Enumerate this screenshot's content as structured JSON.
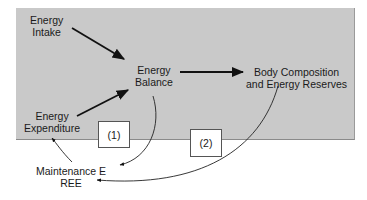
{
  "diagram": {
    "nodes": {
      "energy_intake": [
        "Energy",
        "Intake"
      ],
      "energy_balance": [
        "Energy",
        "Balance"
      ],
      "energy_expenditure": [
        "Energy",
        "Expenditure"
      ],
      "body_composition": [
        "Body Composition",
        "and Energy Reserves"
      ],
      "maintenance": [
        "Maintenance E",
        "REE"
      ]
    },
    "boxes": {
      "box1": "(1)",
      "box2": "(2)"
    },
    "edges": [
      {
        "from": "energy_intake",
        "to": "energy_balance",
        "style": "straight-arrow"
      },
      {
        "from": "energy_expenditure",
        "to": "energy_balance",
        "style": "straight-arrow"
      },
      {
        "from": "energy_balance",
        "to": "body_composition",
        "style": "straight-arrow"
      },
      {
        "from": "energy_balance",
        "to": "maintenance",
        "style": "curved-arrow",
        "label": "(1)"
      },
      {
        "from": "maintenance",
        "to": "energy_expenditure",
        "style": "curved-arrow"
      },
      {
        "from": "body_composition",
        "to": "maintenance",
        "style": "curved-arrow",
        "label": "(2)"
      }
    ],
    "colors": {
      "panel": "#c9c9c9",
      "arrow": "#111111"
    }
  }
}
